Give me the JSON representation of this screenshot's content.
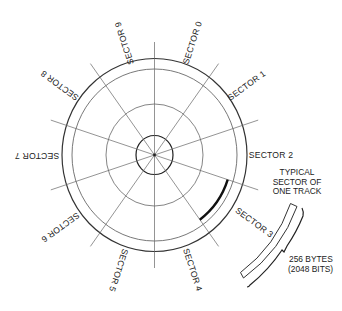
{
  "figure": {
    "type": "disk-sector-diagram",
    "sector_count": 10,
    "sector_labels": [
      {
        "label": "SECTOR 0",
        "x": 193,
        "y": 43,
        "rotate": -72
      },
      {
        "label": "SECTOR 1",
        "x": 247,
        "y": 86,
        "rotate": -36
      },
      {
        "label": "SECTOR 2",
        "x": 271,
        "y": 156,
        "rotate": 0
      },
      {
        "label": "SECTOR 3",
        "x": 254,
        "y": 223,
        "rotate": 36
      },
      {
        "label": "SECTOR 4",
        "x": 192,
        "y": 270,
        "rotate": 72
      },
      {
        "label": "SECTOR 5",
        "x": 118,
        "y": 270,
        "rotate": 108
      },
      {
        "label": "SECTOR 6",
        "x": 60,
        "y": 227,
        "rotate": 144
      },
      {
        "label": "SECTOR 7",
        "x": 37,
        "y": 155,
        "rotate": 180
      },
      {
        "label": "SECTOR 8",
        "x": 60,
        "y": 85,
        "rotate": 216
      },
      {
        "label": "SECTOR 9",
        "x": 125,
        "y": 43,
        "rotate": 252
      }
    ],
    "callout": {
      "lines": [
        "TYPICAL",
        "SECTOR OF",
        "ONE TRACK"
      ]
    },
    "size_note": {
      "lines": [
        "256 BYTES",
        "(2048 BITS)"
      ]
    },
    "colors": {
      "stroke": "#333333",
      "thin_stroke": "#666666",
      "highlight": "#111111",
      "background": "#ffffff"
    }
  }
}
